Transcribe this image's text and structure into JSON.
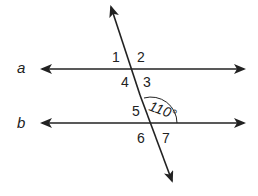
{
  "diagram": {
    "lines": [
      {
        "name": "a",
        "label": "a"
      },
      {
        "name": "b",
        "label": "b"
      }
    ],
    "angle_labels": {
      "a1": "1",
      "a2": "2",
      "a3": "3",
      "a4": "4",
      "a5": "5",
      "a6": "6",
      "a7": "7"
    },
    "given_angle": "110°",
    "colors": {
      "stroke": "#222222",
      "background": "#ffffff"
    }
  }
}
